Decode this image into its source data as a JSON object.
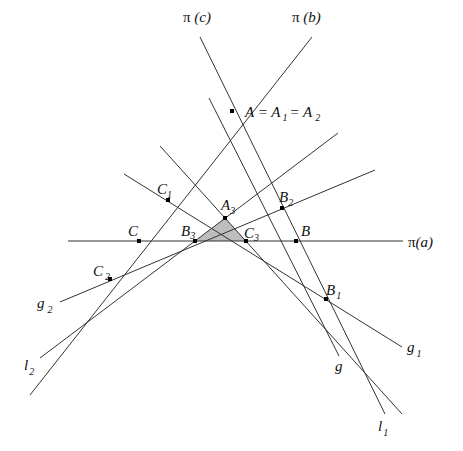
{
  "diagram": {
    "lines": [
      {
        "id": "pi-a",
        "label": "π(a)"
      },
      {
        "id": "pi-b",
        "label": "π(b)"
      },
      {
        "id": "pi-c",
        "label": "π(c)"
      },
      {
        "id": "g",
        "label": "g"
      },
      {
        "id": "g1",
        "label": "g",
        "sub": "1"
      },
      {
        "id": "g2",
        "label": "g",
        "sub": "2"
      },
      {
        "id": "l1",
        "label": "l",
        "sub": "1"
      },
      {
        "id": "l2",
        "label": "l",
        "sub": "2"
      }
    ],
    "points": [
      {
        "id": "A",
        "label": "A = A₁ = A₂",
        "parts": [
          "A = A",
          "1",
          "= A",
          "2"
        ]
      },
      {
        "id": "B",
        "label": "B"
      },
      {
        "id": "C",
        "label": "C"
      },
      {
        "id": "A3",
        "label": "A",
        "sub": "3"
      },
      {
        "id": "B1",
        "label": "B",
        "sub": "1"
      },
      {
        "id": "B2",
        "label": "B",
        "sub": "2"
      },
      {
        "id": "B3",
        "label": "B",
        "sub": "3"
      },
      {
        "id": "C1",
        "label": "C",
        "sub": "1"
      },
      {
        "id": "C2",
        "label": "C",
        "sub": "2"
      },
      {
        "id": "C3",
        "label": "C",
        "sub": "3"
      }
    ],
    "shaded_region": "triangle A3 B3 C3",
    "colors": {
      "line": "#333333",
      "shade": "#bdbdbd",
      "point": "#000000"
    }
  }
}
